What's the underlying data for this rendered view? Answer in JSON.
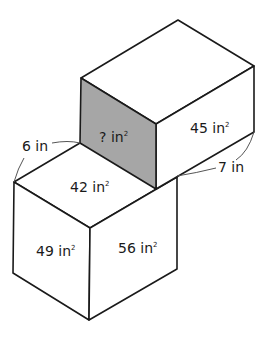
{
  "diagram": {
    "shaded_color": "#a6a6a6",
    "line_color": "#1a1a1a",
    "top_prism": {
      "front_face": {
        "value": "?",
        "unit": "in",
        "exponent": "2"
      },
      "side_face": {
        "value": "45",
        "unit": "in",
        "exponent": "2"
      }
    },
    "bottom_prism": {
      "top_face": {
        "value": "42",
        "unit": "in",
        "exponent": "2"
      },
      "left_face": {
        "value": "49",
        "unit": "in",
        "exponent": "2"
      },
      "right_face": {
        "value": "56",
        "unit": "in",
        "exponent": "2"
      }
    },
    "dimensions": {
      "left_edge": "6 in",
      "right_edge": "7 in"
    }
  }
}
